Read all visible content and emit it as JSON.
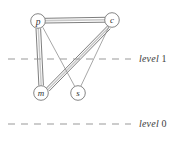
{
  "figure": {
    "name": "level-graph",
    "background": "#ffffff",
    "ink_color": "#555555",
    "label_color": "#3d3d3d",
    "width": 183,
    "height": 141
  },
  "nodes": [
    {
      "id": "p",
      "label": "p",
      "cx": 38,
      "cy": 21,
      "r": 7.5
    },
    {
      "id": "c",
      "label": "c",
      "cx": 112,
      "cy": 20,
      "r": 7.5
    },
    {
      "id": "m",
      "label": "m",
      "cx": 41,
      "cy": 93,
      "r": 7.5
    },
    {
      "id": "s",
      "label": "s",
      "cx": 78,
      "cy": 93,
      "r": 7.5
    }
  ],
  "edges": [
    {
      "id": "p-c",
      "from": "p",
      "to": "c",
      "style": "double"
    },
    {
      "id": "p-m",
      "from": "p",
      "to": "m",
      "style": "double"
    },
    {
      "id": "m-c",
      "from": "m",
      "to": "c",
      "style": "double"
    },
    {
      "id": "p-s",
      "from": "p",
      "to": "s",
      "style": "single"
    },
    {
      "id": "s-c",
      "from": "s",
      "to": "c",
      "style": "single"
    }
  ],
  "levels": [
    {
      "id": "level-1",
      "label": "level",
      "number": "1",
      "y": 59,
      "x_start": 8,
      "x_end": 131
    },
    {
      "id": "level-0",
      "label": "level",
      "number": "0",
      "y": 124,
      "x_start": 8,
      "x_end": 131
    }
  ]
}
